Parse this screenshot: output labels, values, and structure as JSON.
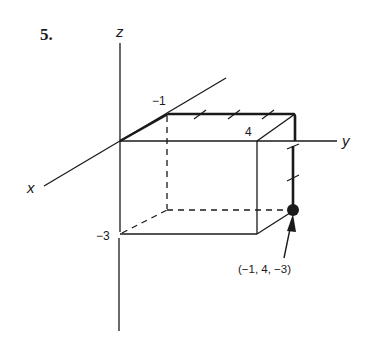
{
  "problem": {
    "number_label": "5."
  },
  "axes": {
    "x_label": "x",
    "y_label": "y",
    "z_label": "z"
  },
  "tick_labels": {
    "x_value": "−1",
    "y_value": "4",
    "z_value": "−3"
  },
  "point": {
    "label": "(−1, 4, −3)",
    "coords": [
      -1,
      4,
      -3
    ]
  },
  "colors": {
    "ink": "#1a1a1a",
    "background": "#ffffff"
  }
}
